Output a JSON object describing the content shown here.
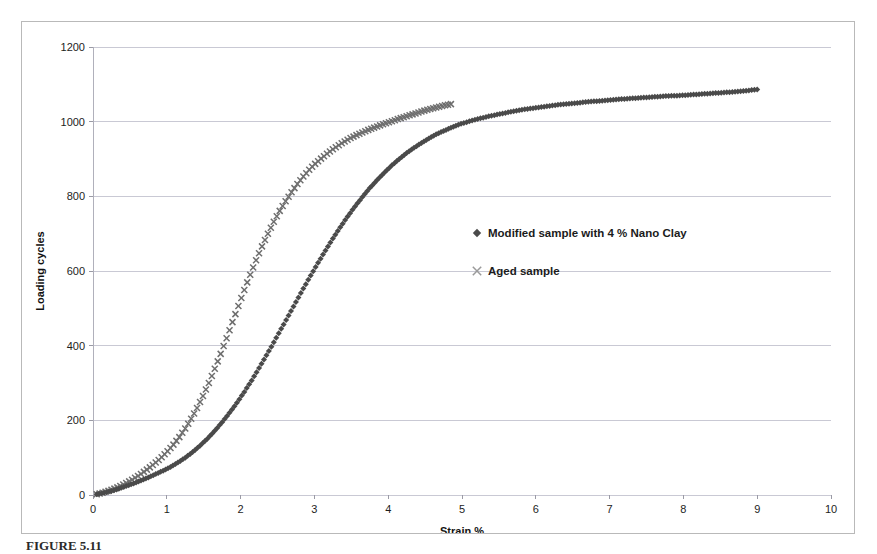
{
  "figure": {
    "caption": "FIGURE 5.11",
    "frame_color": "#b9b9b9",
    "background": "#ffffff"
  },
  "chart_data": {
    "type": "scatter",
    "title": "",
    "xlabel": "Strain %",
    "ylabel": "Loading cycles",
    "xlim": [
      0,
      10
    ],
    "ylim": [
      0,
      1200
    ],
    "xticks": [
      "0",
      "1",
      "2",
      "3",
      "4",
      "5",
      "6",
      "7",
      "8",
      "9",
      "10"
    ],
    "yticks": [
      "0",
      "200",
      "400",
      "600",
      "800",
      "1000",
      "1200"
    ],
    "xtick_values": [
      0,
      1,
      2,
      3,
      4,
      5,
      6,
      7,
      8,
      9,
      10
    ],
    "ytick_values": [
      0,
      200,
      400,
      600,
      800,
      1000,
      1200
    ],
    "grid": {
      "horizontal": true,
      "vertical": false,
      "color": "#c9c9d4"
    },
    "legend": {
      "position": "inside-right",
      "entries": [
        {
          "name": "Modified sample with 4 % Nano Clay",
          "marker": "diamond",
          "color": "#4a4a4a"
        },
        {
          "name": "Aged sample",
          "marker": "cross",
          "color": "#9a9a9a"
        }
      ]
    },
    "series": [
      {
        "name": "Modified sample with 4 % Nano Clay",
        "marker": "diamond",
        "color": "#4a4a4a",
        "x": [
          0.05,
          0.15,
          0.25,
          0.35,
          0.45,
          0.55,
          0.65,
          0.75,
          0.85,
          0.95,
          1.05,
          1.15,
          1.25,
          1.35,
          1.45,
          1.55,
          1.65,
          1.75,
          1.85,
          1.95,
          2.05,
          2.15,
          2.25,
          2.35,
          2.45,
          2.55,
          2.65,
          2.75,
          2.85,
          2.95,
          3.05,
          3.15,
          3.25,
          3.35,
          3.45,
          3.55,
          3.65,
          3.75,
          3.85,
          3.95,
          4.05,
          4.15,
          4.25,
          4.35,
          4.45,
          4.55,
          4.65,
          4.75,
          4.85,
          4.95,
          5.1,
          5.25,
          5.4,
          5.55,
          5.7,
          5.85,
          6.0,
          6.15,
          6.3,
          6.45,
          6.6,
          6.75,
          6.9,
          7.05,
          7.2,
          7.35,
          7.5,
          7.65,
          7.8,
          7.95,
          8.1,
          8.25,
          8.4,
          8.55,
          8.7,
          8.85,
          9.0
        ],
        "y": [
          2,
          6,
          11,
          17,
          24,
          31,
          39,
          47,
          56,
          65,
          75,
          87,
          100,
          115,
          132,
          151,
          172,
          195,
          220,
          247,
          276,
          307,
          340,
          374,
          409,
          445,
          481,
          517,
          553,
          588,
          622,
          655,
          687,
          717,
          746,
          773,
          798,
          822,
          844,
          864,
          883,
          900,
          916,
          930,
          943,
          955,
          966,
          975,
          984,
          992,
          1001,
          1009,
          1016,
          1022,
          1028,
          1033,
          1037,
          1041,
          1045,
          1048,
          1051,
          1054,
          1056,
          1059,
          1061,
          1063,
          1065,
          1067,
          1069,
          1070,
          1072,
          1074,
          1076,
          1078,
          1080,
          1083,
          1086
        ]
      },
      {
        "name": "Aged sample",
        "marker": "cross",
        "color": "#6e6e6e",
        "x": [
          0.05,
          0.13,
          0.21,
          0.29,
          0.37,
          0.45,
          0.53,
          0.61,
          0.69,
          0.77,
          0.85,
          0.93,
          1.01,
          1.09,
          1.17,
          1.25,
          1.33,
          1.41,
          1.49,
          1.57,
          1.65,
          1.73,
          1.81,
          1.89,
          1.97,
          2.05,
          2.13,
          2.21,
          2.29,
          2.37,
          2.45,
          2.53,
          2.61,
          2.69,
          2.77,
          2.85,
          2.93,
          3.01,
          3.09,
          3.17,
          3.25,
          3.33,
          3.41,
          3.49,
          3.57,
          3.65,
          3.73,
          3.81,
          3.89,
          3.97,
          4.05,
          4.13,
          4.21,
          4.29,
          4.37,
          4.45,
          4.53,
          4.61,
          4.69,
          4.77,
          4.85
        ],
        "y": [
          2,
          6,
          11,
          17,
          24,
          32,
          41,
          51,
          62,
          74,
          87,
          101,
          117,
          135,
          155,
          178,
          204,
          233,
          265,
          300,
          338,
          378,
          420,
          463,
          506,
          549,
          590,
          629,
          666,
          700,
          732,
          761,
          787,
          811,
          833,
          853,
          871,
          887,
          901,
          914,
          926,
          937,
          947,
          956,
          964,
          971,
          978,
          984,
          990,
          996,
          1001,
          1007,
          1012,
          1017,
          1022,
          1027,
          1032,
          1036,
          1040,
          1044,
          1047
        ]
      }
    ]
  }
}
